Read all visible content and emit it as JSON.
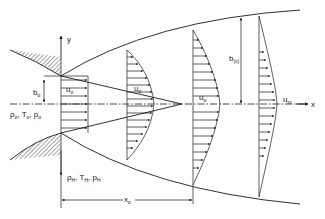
{
  "figure": {
    "type": "free jet velocity profile schematic",
    "axes": {
      "x_label": "x",
      "y_label": "y"
    },
    "labels": {
      "nozzle_half_width": {
        "main": "b",
        "sub": "o"
      },
      "exit_velocity": {
        "main": "u",
        "sub": "o"
      },
      "core_velocity_1": {
        "main": "u",
        "sub": "o"
      },
      "core_velocity_2": {
        "main": "u",
        "sub": "o"
      },
      "centerline_velocity": {
        "main": "u",
        "sub": "m"
      },
      "jet_half_width": {
        "main": "b",
        "sub": "(x)"
      },
      "core_length": {
        "main": "x",
        "sub": "o"
      },
      "jet_state": {
        "rho": "ρ",
        "rho_sub": "o",
        "T": "T",
        "T_sub": "o",
        "p": "p",
        "p_sub": "o",
        "sep": ", "
      },
      "ambient_state": {
        "rho": "ρ",
        "rho_sub": "H",
        "T": "T",
        "T_sub": "H",
        "p": "p",
        "p_sub": "H",
        "sep": ", "
      }
    },
    "colors": {
      "ink": "#1a1a1a",
      "background": "#ffffff"
    }
  }
}
